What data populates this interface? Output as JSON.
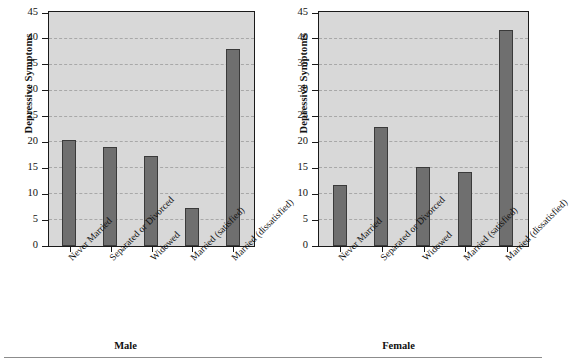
{
  "figure": {
    "background_color": "#ffffff",
    "plot_background_color": "#d8d8d8",
    "bar_color": "#6f6f6f",
    "bar_edge_color": "#3a3a3a",
    "axis_color": "#1a1a1a",
    "gridline_color": "#a8a8a8",
    "bottom_rule": true
  },
  "chart_data": {
    "type": "bar",
    "title": "",
    "xlabel": "",
    "ylabel": "Depressive Symptoms",
    "ylim": [
      0,
      45
    ],
    "yticks": [
      0,
      5,
      10,
      15,
      20,
      25,
      30,
      35,
      40,
      45
    ],
    "ytick_labels": [
      "0",
      "5",
      "10",
      "15",
      "20",
      "25",
      "30",
      "35",
      "40",
      "45"
    ],
    "grid": true,
    "grid_axis": "y",
    "legend": false,
    "categories": [
      "Never Married",
      "Separated or Divorced",
      "Widowed",
      "Married (satisfied)",
      "Married (dissatisfied)"
    ],
    "panels": [
      {
        "label": "Male",
        "values": [
          20.5,
          19.1,
          17.3,
          7.3,
          38.0
        ]
      },
      {
        "label": "Female",
        "values": [
          11.8,
          23.0,
          15.3,
          14.3,
          41.7
        ]
      }
    ]
  }
}
